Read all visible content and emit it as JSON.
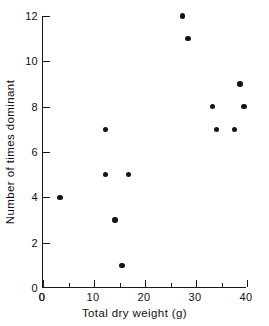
{
  "chart_data": {
    "type": "scatter",
    "title": "",
    "xlabel": "Total dry weight (g)",
    "ylabel": "Number of times dominant",
    "xlim": [
      0,
      40
    ],
    "ylim": [
      0,
      12
    ],
    "grid": false,
    "legend": null,
    "xticks": [
      0,
      10,
      20,
      30,
      40
    ],
    "xticklabels": [
      "0",
      "10",
      "20",
      "30",
      "40"
    ],
    "xminorticks": [
      5,
      15,
      25,
      35
    ],
    "yticks": [
      2,
      4,
      6,
      8,
      10,
      12
    ],
    "yticklabels": [
      "2",
      "4",
      "6",
      "8",
      "10",
      "12"
    ],
    "yminorticks": [],
    "marker": "filled-circle",
    "marker_color": "#151515",
    "points": [
      {
        "x": 3.5,
        "y": 4
      },
      {
        "x": 12.4,
        "y": 7
      },
      {
        "x": 12.4,
        "y": 5
      },
      {
        "x": 17.0,
        "y": 5
      },
      {
        "x": 14.3,
        "y": 3
      },
      {
        "x": 15.7,
        "y": 1
      },
      {
        "x": 27.6,
        "y": 12
      },
      {
        "x": 28.6,
        "y": 11
      },
      {
        "x": 33.4,
        "y": 8
      },
      {
        "x": 34.2,
        "y": 7
      },
      {
        "x": 37.8,
        "y": 7
      },
      {
        "x": 38.8,
        "y": 9
      },
      {
        "x": 39.6,
        "y": 8
      }
    ]
  }
}
